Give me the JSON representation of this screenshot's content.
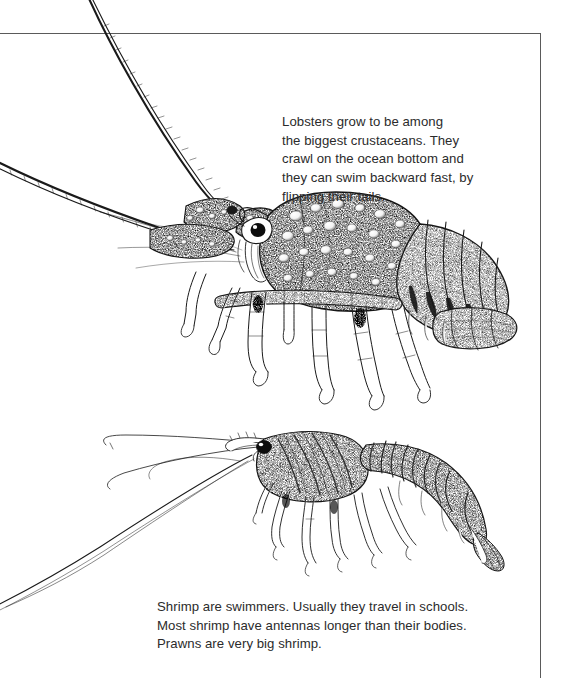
{
  "page": {
    "width": 561,
    "height": 678,
    "background_color": "#ffffff",
    "border_color": "#5a5a5a",
    "ink_color": "#1a1a1a",
    "text_color": "#2b2b2b"
  },
  "captions": {
    "lobster": {
      "text": "Lobsters grow to be among\nthe biggest crustaceans. They\ncrawl on the ocean bottom and\nthey can swim backward fast, by\nflipping their tails.",
      "lines": [
        "Lobsters grow to be among",
        "the biggest crustaceans. They",
        "crawl on the ocean bottom and",
        "they can swim backward fast, by",
        "flipping their tails."
      ]
    },
    "shrimp": {
      "text": "Shrimp are swimmers. Usually they travel in schools.\nMost shrimp have antennas longer than their bodies.\nPrawns are very big shrimp.",
      "lines": [
        "Shrimp are swimmers. Usually they travel in schools.",
        "Most shrimp have antennas longer than their bodies.",
        "Prawns are very big shrimp."
      ]
    }
  },
  "illustrations": [
    {
      "name": "spiny-lobster-drawing",
      "subject": "spiny lobster",
      "style": "pen-and-ink stipple engraving",
      "description": "Side view of a spiny lobster facing left, with two long thick spiny antennae sweeping up and left past the page border, a bumpy stippled carapace, a large dark eye, five pairs of walking legs, a segmented abdomen and a broad tail fan at the right."
    },
    {
      "name": "shrimp-drawing",
      "subject": "shrimp",
      "style": "pen-and-ink stipple engraving",
      "description": "Side view of a shrimp facing left with very long thin antennae trailing down to the lower left, a dark round eye, a striped carapace, slender walking legs and swimmerets, an arching segmented abdomen and a pointed tail fan at the lower right."
    }
  ]
}
